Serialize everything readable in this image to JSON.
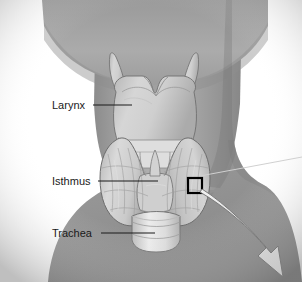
{
  "figure": {
    "background_color": "#ffffff",
    "skin_color": "#a9a9a9",
    "skin_shadow_color": "#8f8f8f",
    "gland_color": "#d8d8d8",
    "outline_color": "#6a6a6a",
    "label_color": "#1a1a1a",
    "callout_box_color": "#000000",
    "arrow_fill_color": "#dcdcdc",
    "arrow_outline_color": "#7a7a7a"
  },
  "labels": [
    {
      "id": "larynx",
      "text": "Larynx",
      "text_x": 52,
      "text_y": 109,
      "leader_x1": 93,
      "leader_y1": 105,
      "leader_x2": 132,
      "leader_y2": 105
    },
    {
      "id": "isthmus",
      "text": "Isthmus",
      "text_x": 52,
      "text_y": 185,
      "leader_x1": 98,
      "leader_y1": 181,
      "leader_x2": 158,
      "leader_y2": 181
    },
    {
      "id": "trachea",
      "text": "Trachea",
      "text_x": 52,
      "text_y": 237,
      "leader_x1": 101,
      "leader_y1": 233,
      "leader_x2": 155,
      "leader_y2": 233
    }
  ],
  "callout": {
    "box": {
      "x": 188,
      "y": 178,
      "width": 14,
      "height": 15
    },
    "thin_leader": {
      "x1": 200,
      "y1": 176,
      "x2": 302,
      "y2": 157
    },
    "arrow_tip_x": 283,
    "arrow_tip_y": 277
  }
}
